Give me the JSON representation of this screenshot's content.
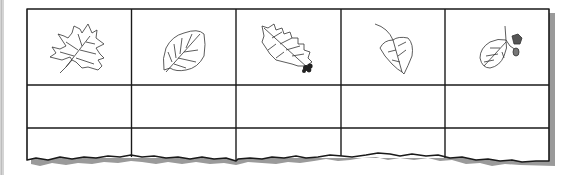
{
  "worksheet": {
    "type": "leaf identification chart",
    "columns": 5,
    "rows": 3,
    "header_row": [
      {
        "icon": "maple-leaf-icon"
      },
      {
        "icon": "birch-leaf-icon"
      },
      {
        "icon": "oak-leaf-with-acorn-icon"
      },
      {
        "icon": "poplar-leaf-icon"
      },
      {
        "icon": "alder-leaf-with-cone-icon"
      }
    ],
    "blank_rows": [
      [
        "",
        "",
        "",
        "",
        ""
      ],
      [
        "",
        "",
        "",
        "",
        ""
      ]
    ],
    "colors": {
      "line": "#1a1a1a",
      "shadow": "#9a9a9a",
      "paper": "#ffffff",
      "left_bar": "#d4d4d4"
    }
  }
}
